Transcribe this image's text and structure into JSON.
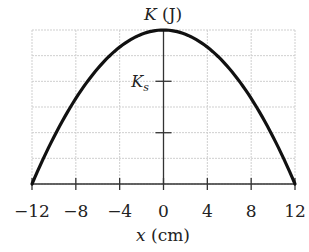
{
  "chart_data": {
    "type": "line",
    "title": "",
    "xlabel": "x (cm)",
    "ylabel": "K (J)",
    "xlim": [
      -12,
      12
    ],
    "ylim": [
      0,
      1
    ],
    "x_ticks": [
      -12,
      -8,
      -4,
      0,
      4,
      8,
      12
    ],
    "x_tick_labels": [
      "−12",
      "−8",
      "−4",
      "0",
      "4",
      "8",
      "12"
    ],
    "y_ticks_fraction_of_max": [
      0.333,
      0.667
    ],
    "y_tick_labels": [
      "",
      "K_s"
    ],
    "grid": true,
    "grid_rows": 6,
    "grid_cols": 6,
    "legend": null,
    "annotations": [
      {
        "text": "K_s",
        "at_fraction_of_max": 0.667
      }
    ],
    "series": [
      {
        "name": "K(x)",
        "description": "Parabolic kinetic energy, maximum at x = 0, zero at x = ±12 cm",
        "x": [
          -12,
          -10,
          -8,
          -6,
          -4,
          -2,
          0,
          2,
          4,
          6,
          8,
          10,
          12
        ],
        "values_fraction_of_max": [
          0,
          0.306,
          0.556,
          0.75,
          0.889,
          0.972,
          1.0,
          0.972,
          0.889,
          0.75,
          0.556,
          0.306,
          0
        ]
      }
    ]
  },
  "labels": {
    "y_axis_title_main": "K",
    "y_axis_title_unit": " (J)",
    "x_axis_title_main": "x",
    "x_axis_title_unit": " (cm)",
    "ks_main": "K",
    "ks_sub": "s"
  }
}
